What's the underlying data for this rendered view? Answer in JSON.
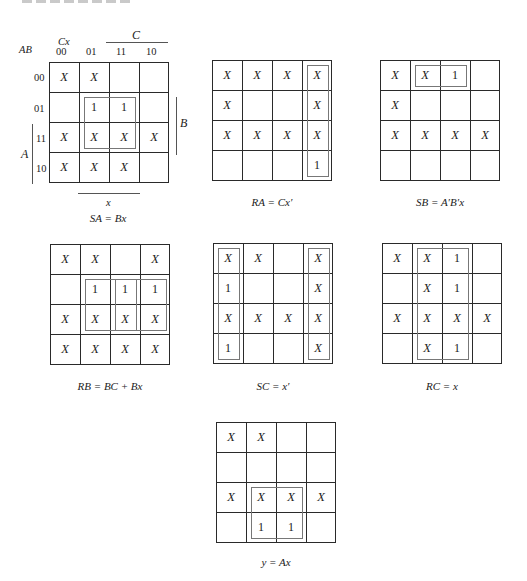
{
  "figure": {
    "axis_labels": {
      "row_var": "AB",
      "col_var": "Cx",
      "col_codes": [
        "00",
        "01",
        "11",
        "10"
      ],
      "row_codes": [
        "00",
        "01",
        "11",
        "10"
      ],
      "C": "C",
      "B": "B",
      "A": "A",
      "x": "x"
    },
    "kmaps": [
      {
        "caption": "SA = Bx",
        "cells": [
          [
            "X",
            "X",
            "",
            ""
          ],
          [
            "",
            "1",
            "1",
            ""
          ],
          [
            "X",
            "X",
            "X",
            "X"
          ],
          [
            "X",
            "X",
            "X",
            ""
          ]
        ],
        "loops": [
          {
            "r": 1,
            "c": 1,
            "rs": 2,
            "cs": 2
          }
        ]
      },
      {
        "caption": "RA = Cx′",
        "cells": [
          [
            "X",
            "X",
            "X",
            "X"
          ],
          [
            "X",
            "",
            "",
            "X"
          ],
          [
            "X",
            "X",
            "X",
            "X"
          ],
          [
            "",
            "",
            "",
            "1"
          ]
        ],
        "loops": [
          {
            "r": 0,
            "c": 3,
            "rs": 4,
            "cs": 1
          }
        ]
      },
      {
        "caption": "SB = A′B′x",
        "cells": [
          [
            "X",
            "X",
            "1",
            ""
          ],
          [
            "X",
            "",
            "",
            ""
          ],
          [
            "X",
            "X",
            "X",
            "X"
          ],
          [
            "",
            "",
            "",
            ""
          ]
        ],
        "loops": [
          {
            "r": 0,
            "c": 1,
            "rs": 1,
            "cs": 2
          }
        ]
      },
      {
        "caption": "RB = BC + Bx",
        "cells": [
          [
            "X",
            "X",
            "",
            "X"
          ],
          [
            "",
            "1",
            "1",
            "1"
          ],
          [
            "X",
            "X",
            "X",
            "X"
          ],
          [
            "X",
            "X",
            "X",
            "X"
          ]
        ],
        "loops": [
          {
            "r": 1,
            "c": 1,
            "rs": 2,
            "cs": 2
          },
          {
            "r": 1,
            "c": 2,
            "rs": 2,
            "cs": 2
          }
        ]
      },
      {
        "caption": "SC = x′",
        "cells": [
          [
            "X",
            "X",
            "",
            "X"
          ],
          [
            "1",
            "",
            "",
            "X"
          ],
          [
            "X",
            "X",
            "X",
            "X"
          ],
          [
            "1",
            "",
            "",
            "X"
          ]
        ],
        "loops": [
          {
            "r": 0,
            "c": 0,
            "rs": 4,
            "cs": 1
          },
          {
            "r": 0,
            "c": 3,
            "rs": 4,
            "cs": 1
          }
        ]
      },
      {
        "caption": "RC = x",
        "cells": [
          [
            "X",
            "X",
            "1",
            ""
          ],
          [
            "",
            "X",
            "1",
            ""
          ],
          [
            "X",
            "X",
            "X",
            "X"
          ],
          [
            "",
            "X",
            "1",
            ""
          ]
        ],
        "loops": [
          {
            "r": 0,
            "c": 1,
            "rs": 4,
            "cs": 2
          }
        ]
      },
      {
        "caption": "y = Ax",
        "cells": [
          [
            "X",
            "X",
            "",
            ""
          ],
          [
            "",
            "",
            "",
            ""
          ],
          [
            "X",
            "X",
            "X",
            "X"
          ],
          [
            "",
            "1",
            "1",
            ""
          ]
        ],
        "loops": [
          {
            "r": 2,
            "c": 1,
            "rs": 2,
            "cs": 2
          }
        ]
      }
    ]
  }
}
